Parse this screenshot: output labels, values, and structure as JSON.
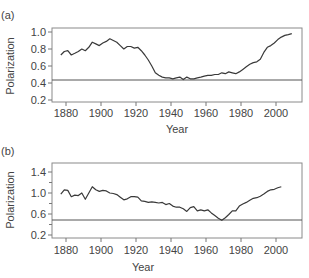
{
  "chart_data": [
    {
      "panel": "(a)",
      "type": "line",
      "title": "",
      "xlabel": "Year",
      "ylabel": "Polarization",
      "xlim": [
        1872,
        2015
      ],
      "ylim": [
        0.17,
        1.06
      ],
      "xticks": [
        1880,
        1900,
        1920,
        1940,
        1960,
        1980,
        2000
      ],
      "yticks": [
        0.2,
        0.4,
        0.6,
        0.8,
        1.0
      ],
      "ytick_labels": [
        "0.2",
        "0.4",
        "0.6",
        "0.8",
        "1.0"
      ],
      "grid": false,
      "legend": null,
      "reference_line": 0.43,
      "x": [
        1877,
        1879,
        1881,
        1883,
        1885,
        1887,
        1889,
        1891,
        1893,
        1895,
        1897,
        1899,
        1901,
        1903,
        1905,
        1907,
        1909,
        1911,
        1913,
        1915,
        1917,
        1919,
        1921,
        1923,
        1925,
        1927,
        1929,
        1931,
        1933,
        1935,
        1937,
        1939,
        1941,
        1943,
        1945,
        1947,
        1949,
        1951,
        1953,
        1955,
        1957,
        1959,
        1961,
        1963,
        1965,
        1967,
        1969,
        1971,
        1973,
        1975,
        1977,
        1979,
        1981,
        1983,
        1985,
        1987,
        1989,
        1991,
        1993,
        1995,
        1997,
        1999,
        2001,
        2003,
        2005,
        2007,
        2009
      ],
      "values": [
        0.73,
        0.77,
        0.78,
        0.73,
        0.75,
        0.77,
        0.8,
        0.78,
        0.82,
        0.88,
        0.86,
        0.84,
        0.87,
        0.89,
        0.92,
        0.9,
        0.88,
        0.84,
        0.8,
        0.83,
        0.83,
        0.81,
        0.82,
        0.78,
        0.73,
        0.67,
        0.6,
        0.52,
        0.49,
        0.47,
        0.46,
        0.46,
        0.45,
        0.46,
        0.47,
        0.44,
        0.47,
        0.45,
        0.45,
        0.46,
        0.47,
        0.48,
        0.49,
        0.49,
        0.5,
        0.5,
        0.52,
        0.51,
        0.53,
        0.52,
        0.51,
        0.53,
        0.56,
        0.59,
        0.62,
        0.64,
        0.65,
        0.68,
        0.76,
        0.82,
        0.84,
        0.87,
        0.91,
        0.94,
        0.96,
        0.97,
        0.98
      ]
    },
    {
      "panel": "(b)",
      "type": "line",
      "title": "",
      "xlabel": "Year",
      "ylabel": "Polarization",
      "xlim": [
        1872,
        2015
      ],
      "ylim": [
        0.15,
        1.6
      ],
      "xticks": [
        1880,
        1900,
        1920,
        1940,
        1960,
        1980,
        2000
      ],
      "yticks": [
        0.2,
        0.6,
        1.0,
        1.4
      ],
      "ytick_labels": [
        "0.2",
        "0.6",
        "1.0",
        "1.4"
      ],
      "minor_yticks": [
        0.4,
        0.8,
        1.2
      ],
      "grid": false,
      "legend": null,
      "reference_line": 0.48,
      "x": [
        1877,
        1879,
        1881,
        1883,
        1885,
        1887,
        1889,
        1891,
        1893,
        1895,
        1897,
        1899,
        1901,
        1903,
        1905,
        1907,
        1909,
        1911,
        1913,
        1915,
        1917,
        1919,
        1921,
        1923,
        1925,
        1927,
        1929,
        1931,
        1933,
        1935,
        1937,
        1939,
        1941,
        1943,
        1945,
        1947,
        1949,
        1951,
        1953,
        1955,
        1957,
        1959,
        1961,
        1963,
        1965,
        1967,
        1969,
        1971,
        1973,
        1975,
        1977,
        1979,
        1981,
        1983,
        1985,
        1987,
        1989,
        1991,
        1993,
        1995,
        1997,
        1999,
        2001,
        2003
      ],
      "values": [
        0.98,
        1.06,
        1.05,
        0.93,
        0.96,
        0.95,
        1.0,
        0.88,
        1.0,
        1.12,
        1.06,
        1.03,
        1.05,
        1.04,
        1.0,
        0.99,
        0.97,
        0.92,
        0.87,
        0.89,
        0.93,
        0.93,
        0.92,
        0.85,
        0.84,
        0.82,
        0.83,
        0.82,
        0.81,
        0.82,
        0.78,
        0.8,
        0.75,
        0.73,
        0.73,
        0.7,
        0.65,
        0.72,
        0.74,
        0.66,
        0.68,
        0.66,
        0.68,
        0.62,
        0.57,
        0.52,
        0.48,
        0.53,
        0.59,
        0.66,
        0.66,
        0.75,
        0.79,
        0.82,
        0.86,
        0.9,
        0.91,
        0.94,
        0.98,
        1.03,
        1.06,
        1.07,
        1.1,
        1.12
      ]
    }
  ],
  "panels": {
    "a": {
      "label": "(a)",
      "ylabel": "Polarization",
      "xlabel": "Year",
      "yticks": [
        {
          "label": "1.0",
          "y": 32
        },
        {
          "label": "0.8",
          "y": 49
        },
        {
          "label": "0.6",
          "y": 66
        },
        {
          "label": "0.4",
          "y": 83
        },
        {
          "label": "0.2",
          "y": 100
        }
      ],
      "xticks": [
        "1880",
        "1900",
        "1920",
        "1940",
        "1960",
        "1980",
        "2000"
      ]
    },
    "b": {
      "label": "(b)",
      "ylabel": "Polarization",
      "xlabel": "Year",
      "yticks": [
        {
          "label": "1.4",
          "y": 172
        },
        {
          "label": "1.0",
          "y": 193
        },
        {
          "label": "0.6",
          "y": 214
        },
        {
          "label": "0.2",
          "y": 235
        }
      ],
      "xticks": [
        "1880",
        "1900",
        "1920",
        "1940",
        "1960",
        "1980",
        "2000"
      ]
    }
  },
  "colors": {
    "line": "#3a3a3a",
    "frame": "#8a8a8a",
    "reference": "#555555",
    "text": "#444444"
  }
}
